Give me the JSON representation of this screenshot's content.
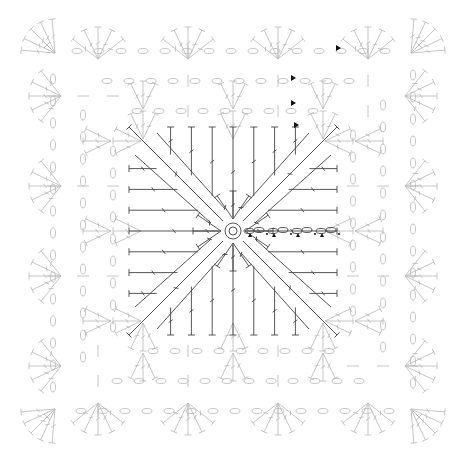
{
  "diagram": {
    "type": "crochet-chart",
    "colors": {
      "inner_rounds": "#444444",
      "outer_rounds": "#b8b8b8",
      "start_markers": "#111111",
      "background": "#ffffff"
    },
    "center": {
      "symbol": "magic-ring"
    },
    "inner_square": {
      "stitch": "double-crochet",
      "stitches_per_side": 9,
      "rows": 9,
      "corner_diagonals": 4
    },
    "start_chain": {
      "chains": 4,
      "markers": 4
    },
    "outer_rounds": {
      "rounds": 3,
      "corner_fans": 4,
      "side_fans_per_side": 4,
      "chain_loop_symbol": "oval",
      "slip_stitch_symbol": "dot",
      "corner_mark_symbol": "x"
    },
    "round_start_markers": 4
  }
}
